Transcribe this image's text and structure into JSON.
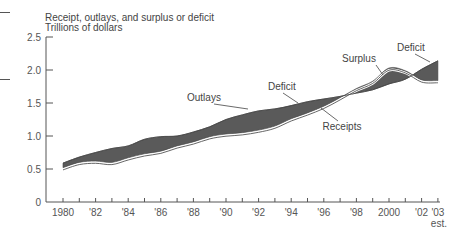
{
  "chart_data": {
    "type": "area",
    "title": "Receipt, outlays, and surplus or deficit",
    "subtitle": "Trillions of dollars",
    "xlabel": "",
    "ylabel": "Trillions of dollars",
    "ylim": [
      0,
      2.5
    ],
    "xlim": [
      1980,
      2003
    ],
    "grid": false,
    "y_ticks": [
      {
        "value": 0,
        "label": "0"
      },
      {
        "value": 0.5,
        "label": "0.5"
      },
      {
        "value": 1.0,
        "label": "1.0"
      },
      {
        "value": 1.5,
        "label": "1.5"
      },
      {
        "value": 2.0,
        "label": "2.0"
      },
      {
        "value": 2.5,
        "label": "2.5"
      }
    ],
    "x_ticks": [
      1980,
      1981,
      1982,
      1983,
      1984,
      1985,
      1986,
      1987,
      1988,
      1989,
      1990,
      1991,
      1992,
      1993,
      1994,
      1995,
      1996,
      1997,
      1998,
      1999,
      2000,
      2001,
      2002,
      2003
    ],
    "x_tick_labels": [
      {
        "year": 1980,
        "label": "1980"
      },
      {
        "year": 1982,
        "label": "'82"
      },
      {
        "year": 1984,
        "label": "'84"
      },
      {
        "year": 1986,
        "label": "'86"
      },
      {
        "year": 1988,
        "label": "'88"
      },
      {
        "year": 1990,
        "label": "'90"
      },
      {
        "year": 1992,
        "label": "'92"
      },
      {
        "year": 1994,
        "label": "'94"
      },
      {
        "year": 1996,
        "label": "'96"
      },
      {
        "year": 1998,
        "label": "'98"
      },
      {
        "year": 2000,
        "label": "2000"
      },
      {
        "year": 2002,
        "label": "'02"
      },
      {
        "year": 2003,
        "label": "'03"
      }
    ],
    "x_tick_sublabel": {
      "year": 2003,
      "label": "est."
    },
    "x": [
      1980,
      1981,
      1982,
      1983,
      1984,
      1985,
      1986,
      1987,
      1988,
      1989,
      1990,
      1991,
      1992,
      1993,
      1994,
      1995,
      1996,
      1997,
      1998,
      1999,
      2000,
      2001,
      2002,
      2003
    ],
    "series": [
      {
        "name": "Receipts",
        "values": [
          0.52,
          0.6,
          0.62,
          0.6,
          0.67,
          0.73,
          0.77,
          0.85,
          0.91,
          0.99,
          1.03,
          1.05,
          1.09,
          1.15,
          1.26,
          1.35,
          1.45,
          1.58,
          1.72,
          1.83,
          2.03,
          1.99,
          1.85,
          1.84
        ]
      },
      {
        "name": "Outlays",
        "values": [
          0.59,
          0.68,
          0.75,
          0.81,
          0.85,
          0.95,
          0.99,
          1.0,
          1.06,
          1.14,
          1.25,
          1.32,
          1.38,
          1.41,
          1.46,
          1.52,
          1.56,
          1.6,
          1.65,
          1.7,
          1.79,
          1.86,
          2.01,
          2.14
        ]
      }
    ],
    "fill": {
      "deficit_color": "#5a5a5a",
      "surplus_color": "#5a5a5a",
      "receipts_line_color": "#555555"
    },
    "annotations": [
      {
        "text": "Outlays",
        "points_to_year": 1990,
        "series": "Outlays"
      },
      {
        "text": "Deficit",
        "points_to_year": 1993,
        "series": "band"
      },
      {
        "text": "Receipts",
        "points_to_year": 1996,
        "series": "Receipts"
      },
      {
        "text": "Surplus",
        "points_to_year": 1999,
        "series": "band"
      },
      {
        "text": "Deficit",
        "points_to_year": 2002.7,
        "series": "band"
      }
    ]
  }
}
